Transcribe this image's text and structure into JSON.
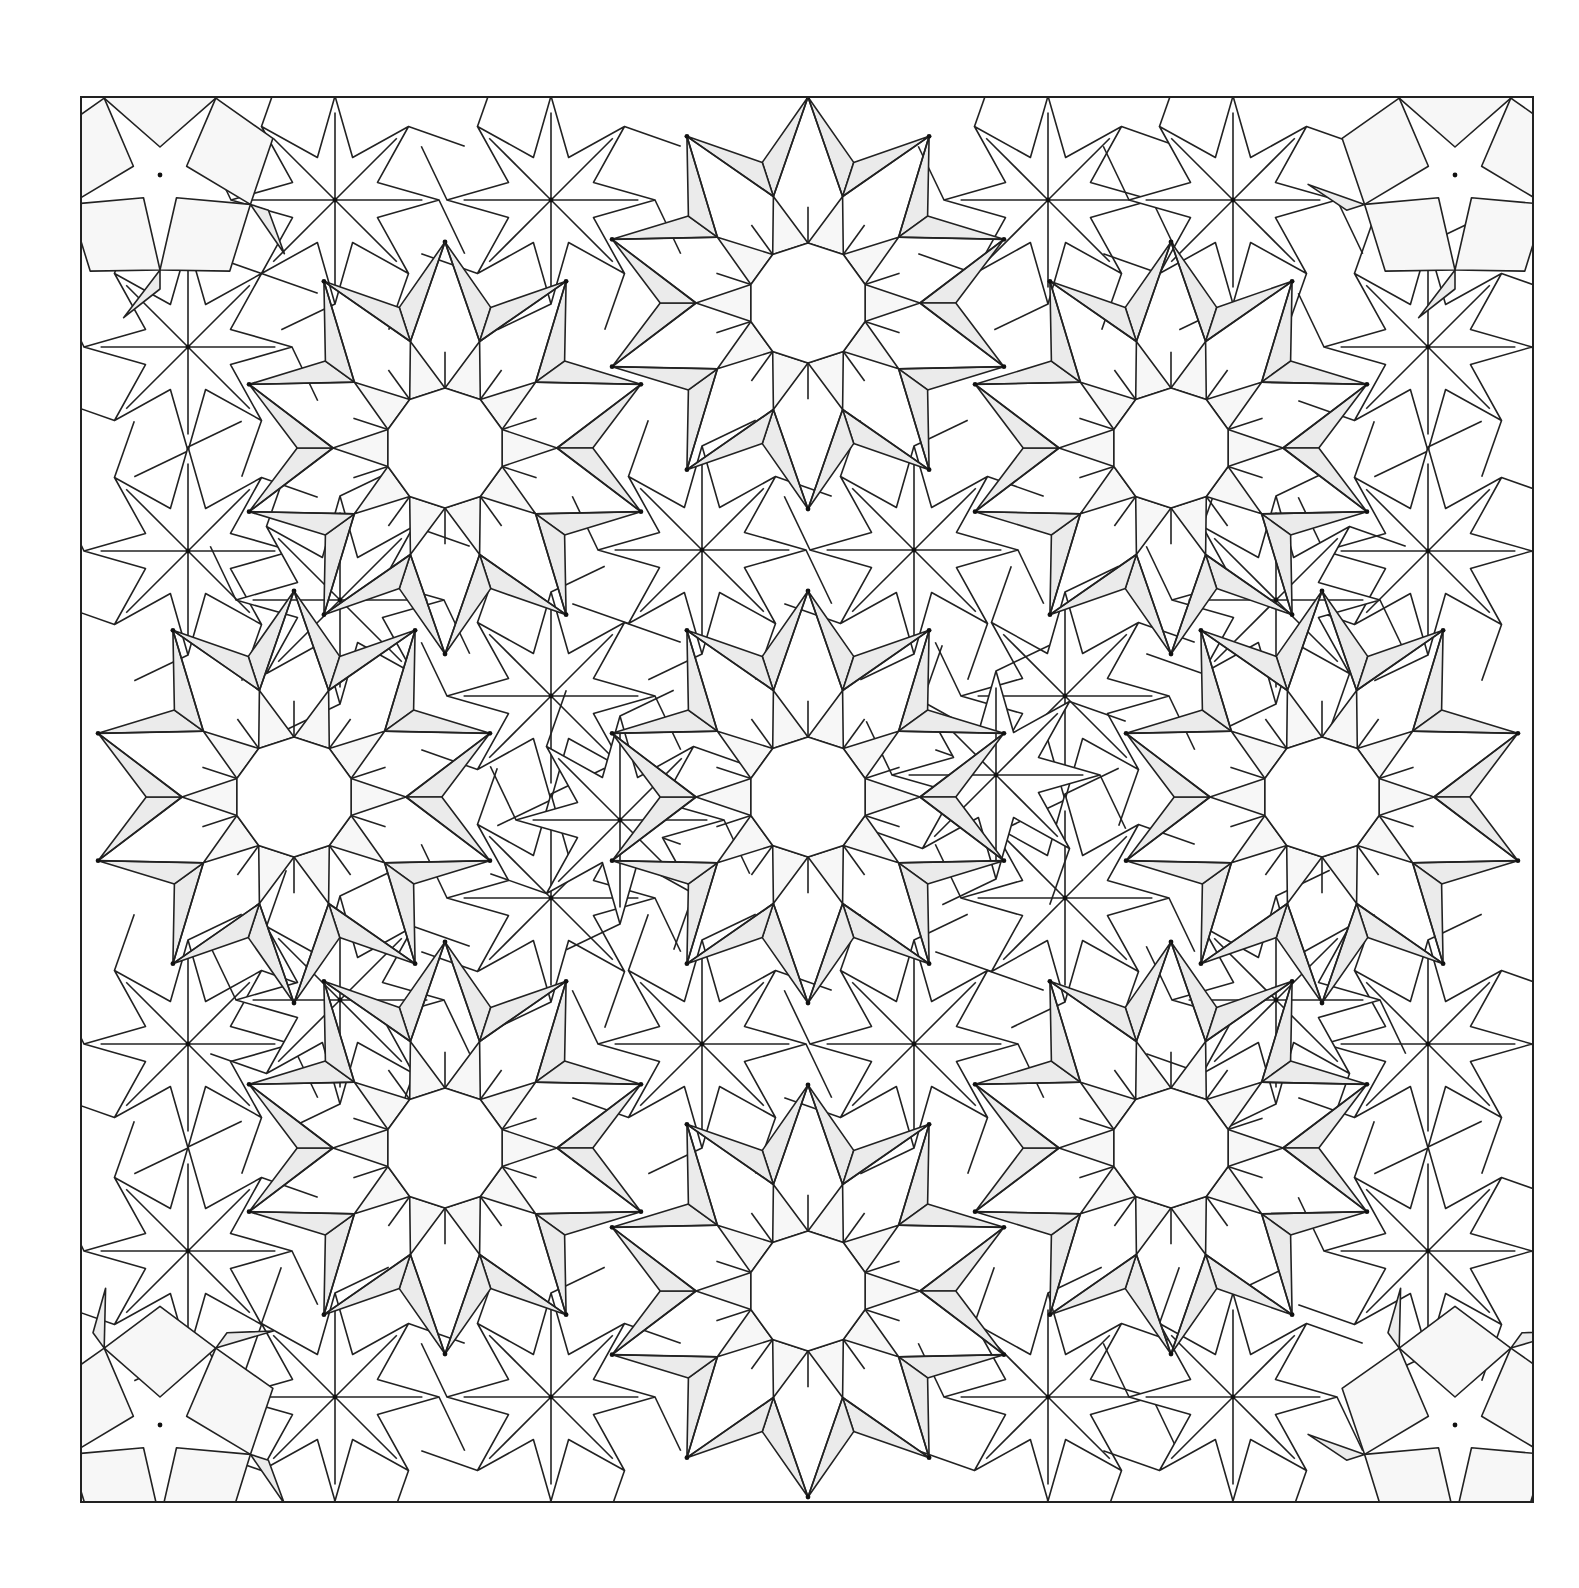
{
  "figure": {
    "frame": {
      "x": 81,
      "y": 97,
      "width": 1452,
      "height": 1405
    },
    "colors": {
      "background": "#ffffff",
      "line": "#222222",
      "dart_fill": "#ebebeb",
      "cell_fill": "#f7f7f7",
      "node": "#111111"
    },
    "stroke_width": 1.6,
    "rosettes": {
      "decagon_radius": 60,
      "ring_radius": 112,
      "point_radius": 206,
      "centers": [
        [
          808,
          303
        ],
        [
          445,
          448
        ],
        [
          1171,
          448
        ],
        [
          294,
          797
        ],
        [
          808,
          797
        ],
        [
          1322,
          797
        ],
        [
          445,
          1148
        ],
        [
          1171,
          1148
        ],
        [
          808,
          1291
        ]
      ]
    },
    "corner_rosettes": {
      "petal_radius": 95,
      "centers": [
        [
          160,
          175
        ],
        [
          1455,
          175
        ],
        [
          160,
          1425
        ],
        [
          1455,
          1425
        ]
      ]
    },
    "stars": {
      "outer_radius": 104,
      "inner_radius": 46,
      "centers": [
        [
          188,
          347
        ],
        [
          188,
          551
        ],
        [
          188,
          1044
        ],
        [
          188,
          1251
        ],
        [
          1428,
          347
        ],
        [
          1428,
          551
        ],
        [
          1428,
          1044
        ],
        [
          1428,
          1251
        ],
        [
          335,
          200
        ],
        [
          551,
          200
        ],
        [
          1048,
          200
        ],
        [
          1233,
          200
        ],
        [
          335,
          1397
        ],
        [
          551,
          1397
        ],
        [
          1048,
          1397
        ],
        [
          1233,
          1397
        ],
        [
          551,
          696
        ],
        [
          702,
          550
        ],
        [
          914,
          550
        ],
        [
          1065,
          696
        ],
        [
          551,
          898
        ],
        [
          702,
          1044
        ],
        [
          914,
          1044
        ],
        [
          1065,
          898
        ],
        [
          620,
          820
        ],
        [
          996,
          775
        ],
        [
          340,
          1000
        ],
        [
          1276,
          600
        ],
        [
          340,
          600
        ],
        [
          1276,
          1000
        ]
      ]
    }
  }
}
